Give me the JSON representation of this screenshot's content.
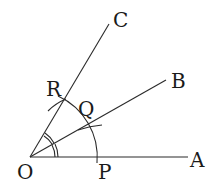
{
  "diagram": {
    "type": "geometric-construction",
    "points": {
      "O": {
        "label": "O",
        "x": 30,
        "y": 157
      },
      "A": {
        "label": "A",
        "x": 188,
        "y": 157
      },
      "B": {
        "label": "B",
        "x": 166,
        "y": 80
      },
      "C": {
        "label": "C",
        "x": 108,
        "y": 25
      },
      "P": {
        "label": "P",
        "x": 97,
        "y": 157
      },
      "Q": {
        "label": "Q",
        "x": 88,
        "y": 125
      },
      "R": {
        "label": "R",
        "x": 63,
        "y": 100
      }
    },
    "rays": [
      "OA",
      "OB",
      "OC"
    ],
    "arc": {
      "center": "O",
      "radius": 67,
      "through": [
        "P",
        "Q",
        "R"
      ]
    },
    "angle_marks": "double arcs marking equal angles AOB and BOC"
  }
}
